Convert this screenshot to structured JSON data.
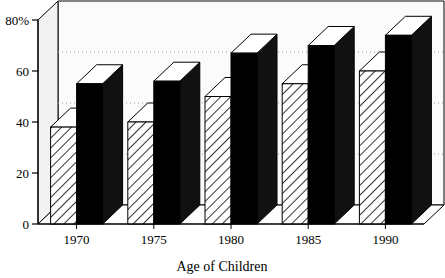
{
  "chart_data": {
    "type": "bar",
    "title": "",
    "xlabel": "Age of Children",
    "ylabel": "",
    "categories": [
      "1970",
      "1975",
      "1980",
      "1985",
      "1990"
    ],
    "series": [
      {
        "name": "hatched-series",
        "values": [
          38,
          40,
          50,
          55,
          60
        ],
        "style": "diagonal-hatch",
        "color": "#ffffff"
      },
      {
        "name": "solid-series",
        "values": [
          55,
          56,
          67,
          70,
          74
        ],
        "style": "solid",
        "color": "#000000"
      }
    ],
    "ylim": [
      0,
      80
    ],
    "yticks": [
      "0",
      "20",
      "40",
      "60",
      "80%"
    ],
    "ytick_values": [
      0,
      20,
      40,
      60,
      80
    ],
    "grid": true,
    "grid_style": "dotted",
    "legend": "none",
    "three_d": true,
    "plot_background": "#fbfbfb",
    "axis_color": "#000000"
  },
  "axis": {
    "y_unit_suffix": "%",
    "x_title": "Age of Children"
  }
}
